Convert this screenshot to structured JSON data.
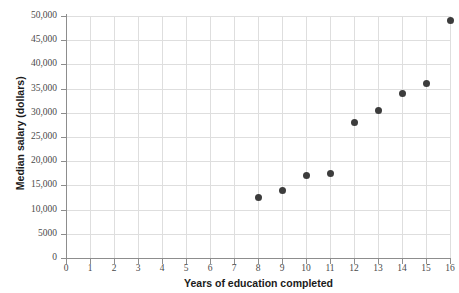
{
  "chart_data": {
    "type": "scatter",
    "title": "",
    "xlabel": "Years of education completed",
    "ylabel": "Median salary (dollars)",
    "xlim": [
      0,
      16
    ],
    "ylim": [
      0,
      50000
    ],
    "grid": true,
    "legend": "none",
    "x_ticks": [
      "0",
      "1",
      "2",
      "3",
      "4",
      "5",
      "6",
      "7",
      "8",
      "9",
      "10",
      "11",
      "12",
      "13",
      "14",
      "15",
      "16"
    ],
    "x_tick_values": [
      0,
      1,
      2,
      3,
      4,
      5,
      6,
      7,
      8,
      9,
      10,
      11,
      12,
      13,
      14,
      15,
      16
    ],
    "y_ticks": [
      "0",
      "5000",
      "10,000",
      "15,000",
      "20,000",
      "25,000",
      "30,000",
      "35,000",
      "40,000",
      "45,000",
      "50,000"
    ],
    "y_tick_values": [
      0,
      5000,
      10000,
      15000,
      20000,
      25000,
      30000,
      35000,
      40000,
      45000,
      50000
    ],
    "x": [
      8,
      9,
      10,
      11,
      12,
      13,
      14,
      15,
      16
    ],
    "y": [
      12500,
      14000,
      17000,
      17500,
      28000,
      30500,
      34000,
      36000,
      49000
    ],
    "points": [
      {
        "x": 8,
        "y": 12500
      },
      {
        "x": 9,
        "y": 14000
      },
      {
        "x": 10,
        "y": 17000
      },
      {
        "x": 11,
        "y": 17500
      },
      {
        "x": 12,
        "y": 28000
      },
      {
        "x": 13,
        "y": 30500
      },
      {
        "x": 14,
        "y": 34000
      },
      {
        "x": 15,
        "y": 36000
      },
      {
        "x": 16,
        "y": 49000
      }
    ],
    "marker_color": "#3c3c3c",
    "grid_color": "#dedede",
    "axis_color": "#8d8d8d"
  }
}
